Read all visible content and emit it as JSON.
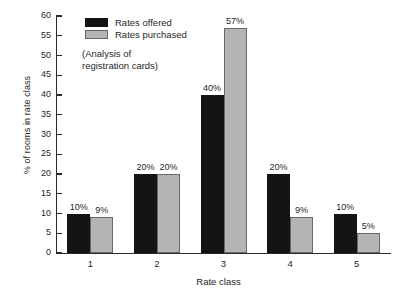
{
  "chart_data": {
    "type": "bar",
    "title": "",
    "xlabel": "Rate class",
    "ylabel": "% of rooms in rate class",
    "categories": [
      "1",
      "2",
      "3",
      "4",
      "5"
    ],
    "series": [
      {
        "name": "Rates offered",
        "color": "#141414",
        "values": [
          10,
          20,
          40,
          20,
          10
        ],
        "labels": [
          "10%",
          "20%",
          "40%",
          "20%",
          "10%"
        ]
      },
      {
        "name": "Rates purchased",
        "color": "#b4b4b4",
        "values": [
          9,
          20,
          57,
          9,
          5
        ],
        "labels": [
          "9%",
          "20%",
          "57%",
          "9%",
          "5%"
        ]
      }
    ],
    "ylim": [
      0,
      60
    ],
    "yticks": [
      0,
      5,
      10,
      15,
      20,
      25,
      30,
      35,
      40,
      45,
      50,
      55,
      60
    ],
    "ytick_labels": [
      "0",
      "5",
      "10",
      "15",
      "20",
      "25",
      "30",
      "35",
      "40",
      "45",
      "50",
      "55",
      "60"
    ],
    "grid": false,
    "legend_position": "top-left",
    "annotations": [
      "(Analysis of",
      "registration cards)"
    ]
  },
  "legend": {
    "items": [
      {
        "label": "Rates offered"
      },
      {
        "label": "Rates purchased"
      }
    ],
    "note_line_1": "(Analysis of",
    "note_line_2": "registration cards)"
  },
  "axes": {
    "x_title": "Rate class",
    "y_title": "% of rooms in rate class"
  }
}
